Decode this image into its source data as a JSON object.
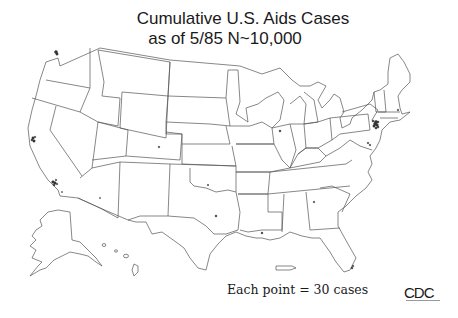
{
  "title": {
    "line1": "Cumulative U.S. Aids Cases",
    "line2": "as of 5/85 N~10,000"
  },
  "legend": {
    "text": "Each point = 30 cases"
  },
  "logo": {
    "text": "CDC"
  },
  "map": {
    "type": "dot-density",
    "region": "United States (incl. Alaska, Hawaii, Puerto Rico)",
    "dot_value": 30,
    "total_cases_approx": 10000,
    "line_color": "#555555",
    "dot_color": "#333333",
    "clusters": [
      {
        "name": "New York City",
        "density": "very high"
      },
      {
        "name": "San Francisco",
        "density": "high"
      },
      {
        "name": "Los Angeles",
        "density": "high"
      },
      {
        "name": "Seattle",
        "density": "medium"
      },
      {
        "name": "Miami / South Florida",
        "density": "medium"
      },
      {
        "name": "Washington DC / Baltimore",
        "density": "medium"
      },
      {
        "name": "Houston",
        "density": "low"
      },
      {
        "name": "Chicago",
        "density": "low"
      },
      {
        "name": "New Orleans",
        "density": "low"
      },
      {
        "name": "Boston",
        "density": "low"
      }
    ]
  }
}
